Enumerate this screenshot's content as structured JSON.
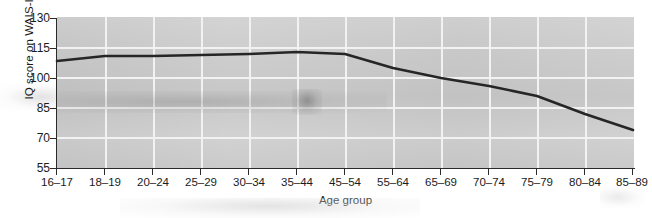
{
  "chart_data": {
    "type": "line",
    "title": "",
    "subtitle": "",
    "xlabel": "Age group",
    "ylabel": "IQ score on WAIS-III",
    "categories": [
      "16–17",
      "18–19",
      "20–24",
      "25–29",
      "30–34",
      "35–44",
      "45–54",
      "55–64",
      "65–69",
      "70–74",
      "75–79",
      "80–84",
      "85–89"
    ],
    "values": [
      108.5,
      111,
      111,
      111.5,
      112,
      113,
      112,
      105,
      100,
      96,
      91,
      82,
      74
    ],
    "series": [
      {
        "name": "IQ score on WAIS-III",
        "values": [
          108.5,
          111,
          111,
          111.5,
          112,
          113,
          112,
          105,
          100,
          96,
          91,
          82,
          74
        ],
        "color": "#262626"
      }
    ],
    "ylim": [
      55,
      130
    ],
    "yticks": [
      130,
      115,
      100,
      85,
      70,
      55
    ],
    "ytick_labels": [
      "130",
      "115",
      "100",
      "85",
      "70",
      "55"
    ],
    "grid": "both-white-on-gray",
    "legend": "none",
    "plot_background": "#cdcdcd",
    "gridline_color": "#f2f2f2",
    "line_color": "#262626",
    "axis_color": "#2a2a2a"
  }
}
